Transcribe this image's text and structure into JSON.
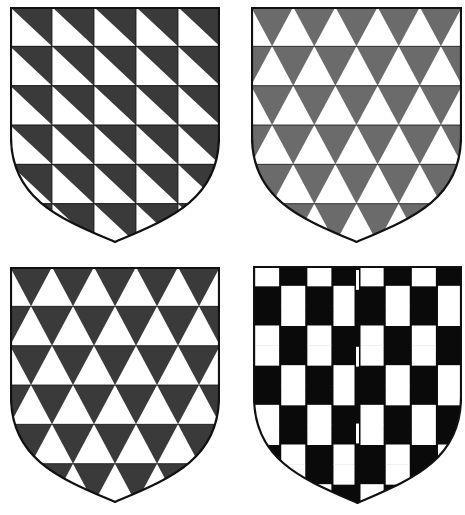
{
  "colors": {
    "background": "#ffffff",
    "outline": "#111111",
    "dark_gray": "#3a3a3a",
    "mid_gray": "#6b6b6b",
    "black": "#0a0a0a",
    "white": "#ffffff"
  },
  "shields": [
    {
      "id": "shield-barry-bendy-dark",
      "pattern": "barry-per-bend",
      "fill": "dark_gray",
      "x": 10,
      "y": 7,
      "w": 210,
      "h": 236,
      "cols": 5,
      "rows": 6
    },
    {
      "id": "shield-triangles-gray",
      "pattern": "triangles",
      "fill": "mid_gray",
      "x": 251,
      "y": 7,
      "w": 211,
      "h": 236,
      "cols": 5,
      "rows": 6
    },
    {
      "id": "shield-triangles-dark",
      "pattern": "triangles",
      "fill": "dark_gray",
      "x": 10,
      "y": 267,
      "w": 210,
      "h": 236,
      "cols": 5,
      "rows": 6
    },
    {
      "id": "shield-potent",
      "pattern": "potent",
      "fill": "black",
      "x": 253,
      "y": 266,
      "w": 209,
      "h": 238,
      "cols": 4,
      "rows": 6
    }
  ]
}
